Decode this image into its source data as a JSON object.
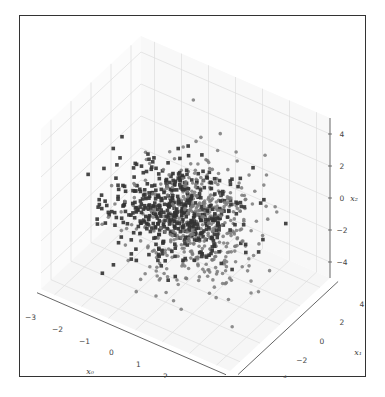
{
  "chart_data": {
    "type": "scatter",
    "projection": "3d",
    "title": "",
    "xlabel": "x0",
    "ylabel": "x1",
    "zlabel": "x2",
    "xlim": [
      -3.5,
      3.5
    ],
    "ylim": [
      -5,
      5
    ],
    "zlim": [
      -5,
      5
    ],
    "x_ticks": [
      -3,
      -2,
      -1,
      0,
      1,
      2,
      3
    ],
    "y_ticks": [
      -4,
      -2,
      0,
      2,
      4
    ],
    "z_ticks": [
      -4,
      -2,
      0,
      2,
      4
    ],
    "grid": true,
    "legend": null,
    "series": [
      {
        "name": "class 0",
        "marker": "square",
        "color": "#333333",
        "count": 480,
        "description": "dark square markers concentrated in a horizontal band near x2≈0, spreading toward negative x0"
      },
      {
        "name": "class 1",
        "marker": "circle",
        "color": "#777777",
        "count": 520,
        "description": "grey round markers spread from x2≈-4 to x2≈3, centered toward positive x1"
      }
    ]
  },
  "axes": {
    "x_tick_labels": [
      "−3",
      "−2",
      "−1",
      "0",
      "1",
      "2",
      "3"
    ],
    "y_tick_labels": [
      "−4",
      "−2",
      "0",
      "2",
      "4"
    ],
    "z_tick_labels": [
      "−4",
      "−2",
      "0",
      "2",
      "4"
    ],
    "x_label": "x₀",
    "y_label": "x₁",
    "z_label": "x₂"
  },
  "colors": {
    "frame": "#333333",
    "grid": "#dddddd",
    "axis": "#555555",
    "dark_points": "#333333",
    "light_points": "#7a7a7a"
  }
}
